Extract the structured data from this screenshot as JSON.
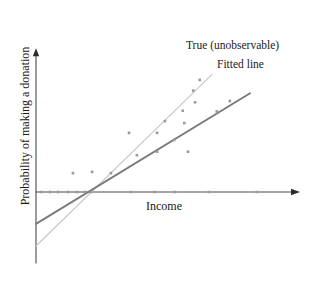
{
  "figure": {
    "background_color": "#ffffff",
    "width": 315,
    "height": 288
  },
  "labels": {
    "true_line": "True (unobservable)",
    "fitted_line": "Fitted line",
    "xaxis": "Income",
    "yaxis": "Probability of making a donation"
  },
  "colors": {
    "axis": "#4a4a4a",
    "true_line": "#c9c9c9",
    "fitted_line": "#7a7a7a",
    "point": "#9a9a9a",
    "text": "#1a1a1a"
  },
  "chart_data": {
    "type": "scatter",
    "title": "",
    "xlabel": "Income",
    "ylabel": "Probability of making a donation",
    "grid": false,
    "legend": "annotations",
    "axis_ticks": false,
    "xlim": [
      0,
      1
    ],
    "ylim": [
      -0.55,
      1.0
    ],
    "annotations": [
      {
        "text": "True (unobservable)",
        "x": 0.57,
        "y": 0.93
      },
      {
        "text": "Fitted line",
        "x": 0.69,
        "y": 0.8
      }
    ],
    "series": [
      {
        "name": "Observations",
        "type": "scatter",
        "marker": "dot",
        "points": [
          {
            "x": 0.019,
            "y": 0.0
          },
          {
            "x": 0.053,
            "y": 0.0
          },
          {
            "x": 0.084,
            "y": 0.0
          },
          {
            "x": 0.122,
            "y": 0.0
          },
          {
            "x": 0.156,
            "y": 0.0
          },
          {
            "x": 0.187,
            "y": 0.0
          },
          {
            "x": 0.21,
            "y": 0.0
          },
          {
            "x": 0.362,
            "y": 0.0
          },
          {
            "x": 0.453,
            "y": 0.0
          },
          {
            "x": 0.53,
            "y": 0.0
          },
          {
            "x": 0.66,
            "y": 0.0
          },
          {
            "x": 0.843,
            "y": 0.0
          },
          {
            "x": 0.141,
            "y": 0.145
          },
          {
            "x": 0.214,
            "y": 0.155
          },
          {
            "x": 0.286,
            "y": 0.145
          },
          {
            "x": 0.385,
            "y": 0.283
          },
          {
            "x": 0.355,
            "y": 0.455
          },
          {
            "x": 0.462,
            "y": 0.31
          },
          {
            "x": 0.462,
            "y": 0.455
          },
          {
            "x": 0.492,
            "y": 0.545
          },
          {
            "x": 0.527,
            "y": 0.4
          },
          {
            "x": 0.566,
            "y": 0.53
          },
          {
            "x": 0.56,
            "y": 0.625
          },
          {
            "x": 0.58,
            "y": 0.31
          },
          {
            "x": 0.607,
            "y": 0.69
          },
          {
            "x": 0.6,
            "y": 0.78
          },
          {
            "x": 0.625,
            "y": 0.862
          },
          {
            "x": 0.69,
            "y": 0.62
          },
          {
            "x": 0.74,
            "y": 0.7
          }
        ]
      },
      {
        "name": "True (unobservable)",
        "type": "line",
        "style": "thin-light",
        "x_start": 0.0,
        "y_start": -0.415,
        "x_end": 0.672,
        "y_end": 0.905
      },
      {
        "name": "Fitted line",
        "type": "line",
        "style": "thick-dark",
        "x_start": 0.0,
        "y_start": -0.245,
        "x_end": 0.817,
        "y_end": 0.76
      }
    ],
    "axes": {
      "yaxis": {
        "x": 0.0,
        "y_bottom": -0.55,
        "y_top": 1.06,
        "arrow": "up"
      },
      "xaxis": {
        "y": 0.0,
        "x_left": 0.0,
        "x_right": 1.0,
        "arrow": "right"
      }
    }
  }
}
